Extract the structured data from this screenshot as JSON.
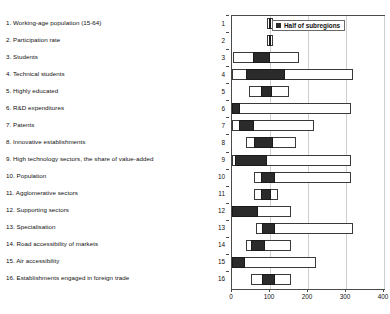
{
  "chart_data": {
    "type": "bar",
    "title": "",
    "subtitle": "",
    "xlabel": "",
    "ylabel": "",
    "xlim": [
      0,
      400
    ],
    "xticks": [
      0,
      100,
      200,
      300,
      400
    ],
    "xtick_labels": [
      "0",
      "100",
      "200",
      "300",
      "400"
    ],
    "grid": true,
    "grid_axis": "x",
    "orientation": "horizontal",
    "legend": {
      "position": "top-right",
      "entries": [
        {
          "label": "Half of subregions",
          "color": "#2b2b2b",
          "marker": "square"
        }
      ]
    },
    "categories": [
      "1",
      "2",
      "3",
      "4",
      "5",
      "6",
      "7",
      "8",
      "9",
      "10",
      "11",
      "12",
      "13",
      "14",
      "15",
      "16"
    ],
    "category_labels": [
      "1. Working-age population (15-64)",
      "2. Participation rate",
      "3. Students",
      "4. Technical students",
      "5. Highly educated",
      "6. R&D expenditures",
      "7. Patents",
      "8. Innovative establishments",
      "9. High technology sectors, the share of value-added",
      "10. Population",
      "11. Agglomerative sectors",
      "12. Supporting sectors",
      "13. Specialisation",
      "14. Road accessibility of markets",
      "15. Air accessibility",
      "16. Establishments engaged in foreign trade"
    ],
    "series": [
      {
        "name": "Range (min to max)",
        "field": "range",
        "color": "#ffffff",
        "edge_color": "#3a3a3a"
      },
      {
        "name": "Half of subregions",
        "field": "box",
        "color": "#2b2b2b",
        "edge_color": "#1a1a1a"
      }
    ],
    "rows": [
      {
        "n": "1",
        "label": "Working-age population (15-64)",
        "range_min": 92,
        "range_max": 107,
        "box_min": 97,
        "box_max": 102
      },
      {
        "n": "2",
        "label": "Participation rate",
        "range_min": 92,
        "range_max": 107,
        "box_min": 97,
        "box_max": 102
      },
      {
        "n": "3",
        "label": "Students",
        "range_min": 3,
        "range_max": 177,
        "box_min": 55,
        "box_max": 100
      },
      {
        "n": "4",
        "label": "Technical students",
        "range_min": 0,
        "range_max": 319,
        "box_min": 37,
        "box_max": 140
      },
      {
        "n": "5",
        "label": "Highly educated",
        "range_min": 45,
        "range_max": 150,
        "box_min": 76,
        "box_max": 105
      },
      {
        "n": "6",
        "label": "R&D expenditures",
        "range_min": 0,
        "range_max": 313,
        "box_min": 0,
        "box_max": 22
      },
      {
        "n": "7",
        "label": "Patents",
        "range_min": 0,
        "range_max": 216,
        "box_min": 18,
        "box_max": 58
      },
      {
        "n": "8",
        "label": "Innovative establishments",
        "range_min": 37,
        "range_max": 168,
        "box_min": 58,
        "box_max": 108
      },
      {
        "n": "9",
        "label": "High technology sectors, the share of value-added",
        "range_min": 0,
        "range_max": 313,
        "box_min": 8,
        "box_max": 92
      },
      {
        "n": "10",
        "label": "Population",
        "range_min": 58,
        "range_max": 313,
        "box_min": 76,
        "box_max": 113
      },
      {
        "n": "11",
        "label": "Agglomerative sectors",
        "range_min": 58,
        "range_max": 121,
        "box_min": 76,
        "box_max": 103
      },
      {
        "n": "12",
        "label": "Supporting sectors",
        "range_min": 0,
        "range_max": 155,
        "box_min": 0,
        "box_max": 68
      },
      {
        "n": "13",
        "label": "Specialisation",
        "range_min": 63,
        "range_max": 318,
        "box_min": 79,
        "box_max": 113
      },
      {
        "n": "14",
        "label": "Road accessibility of markets",
        "range_min": 37,
        "range_max": 155,
        "box_min": 50,
        "box_max": 87
      },
      {
        "n": "15",
        "label": "Air accessibility",
        "range_min": 0,
        "range_max": 221,
        "box_min": 0,
        "box_max": 34
      },
      {
        "n": "16",
        "label": "Establishments engaged in foreign trade",
        "range_min": 50,
        "range_max": 155,
        "box_min": 79,
        "box_max": 113
      }
    ]
  }
}
